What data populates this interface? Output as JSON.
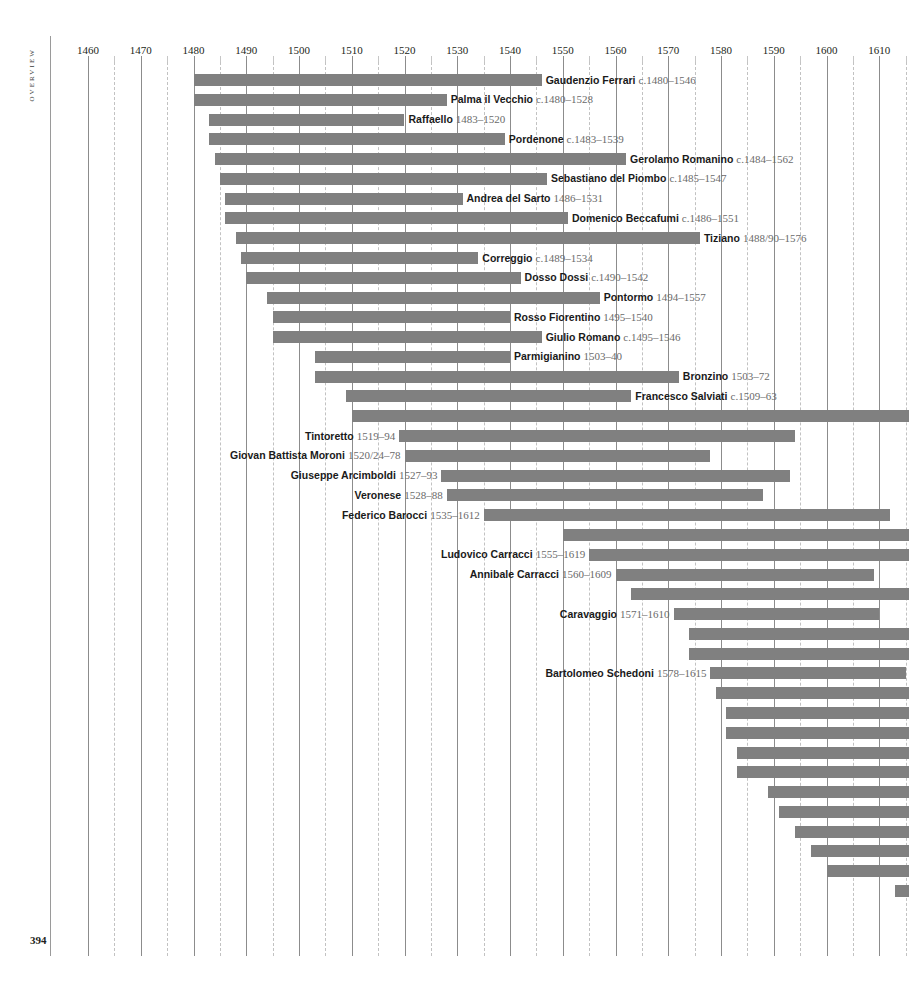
{
  "page": {
    "folio": "394",
    "running_head": "Overview",
    "bar_color": "#808080",
    "grid_major_color": "#8c8c8c",
    "grid_minor_color": "#c2c2c2"
  },
  "chart_data": {
    "type": "bar",
    "orientation": "horizontal",
    "title": "Overview",
    "xlabel": "",
    "ylabel": "",
    "xlim": [
      1455,
      1616
    ],
    "grid": true,
    "legend": null,
    "axis": {
      "major_ticks": [
        1460,
        1470,
        1480,
        1490,
        1500,
        1510,
        1520,
        1530,
        1540,
        1550,
        1560,
        1570,
        1580,
        1590,
        1600,
        1610
      ],
      "minor_ticks": [
        1465,
        1475,
        1485,
        1495,
        1505,
        1515,
        1525,
        1535,
        1545,
        1555,
        1565,
        1575,
        1585,
        1595,
        1605,
        1615
      ],
      "tick_labels": [
        "1460",
        "1470",
        "1480",
        "1490",
        "1500",
        "1510",
        "1520",
        "1530",
        "1540",
        "1550",
        "1560",
        "1570",
        "1580",
        "1590",
        "1600",
        "1610"
      ]
    },
    "categories": [
      "Gaudenzio Ferrari",
      "Palma il Vecchio",
      "Raffaello",
      "Pordenone",
      "Gerolamo Romanino",
      "Sebastiano del Piombo",
      "Andrea del Sarto",
      "Domenico Beccafumi",
      "Tiziano",
      "Correggio",
      "Dosso Dossi",
      "Pontormo",
      "Rosso Fiorentino",
      "Giulio Romano",
      "Parmigianino",
      "Bronzino",
      "Francesco Salviati",
      "Jacopo Bassano",
      "Tintoretto",
      "Giovan Battista Moroni",
      "Giuseppe Arcimboldi",
      "Veronese",
      "Federico Barocci",
      "",
      "Ludovico Carracci",
      "Annibale Carracci",
      "",
      "Caravaggio",
      "",
      "",
      "Bartolomeo Schedoni",
      "",
      "",
      "",
      "",
      "",
      "",
      "",
      "",
      "",
      "",
      ""
    ],
    "bars": [
      {
        "name": "Gaudenzio Ferrari",
        "dates": "c.1480–1546",
        "start": 1480,
        "end": 1546,
        "label_side": "right",
        "labelled": true
      },
      {
        "name": "Palma il Vecchio",
        "dates": "c.1480–1528",
        "start": 1480,
        "end": 1528,
        "label_side": "right",
        "labelled": true
      },
      {
        "name": "Raffaello",
        "dates": "1483–1520",
        "start": 1483,
        "end": 1520,
        "label_side": "right",
        "labelled": true
      },
      {
        "name": "Pordenone",
        "dates": "c.1483–1539",
        "start": 1483,
        "end": 1539,
        "label_side": "right",
        "labelled": true
      },
      {
        "name": "Gerolamo Romanino",
        "dates": "c.1484–1562",
        "start": 1484,
        "end": 1562,
        "label_side": "right",
        "labelled": true
      },
      {
        "name": "Sebastiano del Piombo",
        "dates": "c.1485–1547",
        "start": 1485,
        "end": 1547,
        "label_side": "right",
        "labelled": true
      },
      {
        "name": "Andrea del Sarto",
        "dates": "1486–1531",
        "start": 1486,
        "end": 1531,
        "label_side": "right",
        "labelled": true
      },
      {
        "name": "Domenico Beccafumi",
        "dates": "c.1486–1551",
        "start": 1486,
        "end": 1551,
        "label_side": "right",
        "labelled": true
      },
      {
        "name": "Tiziano",
        "dates": "1488/90–1576",
        "start": 1488,
        "end": 1576,
        "label_side": "right",
        "labelled": true
      },
      {
        "name": "Correggio",
        "dates": "c.1489–1534",
        "start": 1489,
        "end": 1534,
        "label_side": "right",
        "labelled": true
      },
      {
        "name": "Dosso Dossi",
        "dates": "c.1490–1542",
        "start": 1490,
        "end": 1542,
        "label_side": "right",
        "labelled": true
      },
      {
        "name": "Pontormo",
        "dates": "1494–1557",
        "start": 1494,
        "end": 1557,
        "label_side": "right",
        "labelled": true
      },
      {
        "name": "Rosso Fiorentino",
        "dates": "1495–1540",
        "start": 1495,
        "end": 1540,
        "label_side": "right",
        "labelled": true
      },
      {
        "name": "Giulio Romano",
        "dates": "c.1495–1546",
        "start": 1495,
        "end": 1546,
        "label_side": "right",
        "labelled": true
      },
      {
        "name": "Parmigianino",
        "dates": "1503–40",
        "start": 1503,
        "end": 1540,
        "label_side": "right",
        "labelled": true
      },
      {
        "name": "Bronzino",
        "dates": "1503–72",
        "start": 1503,
        "end": 1572,
        "label_side": "right",
        "labelled": true
      },
      {
        "name": "Francesco Salviati",
        "dates": "c.1509–63",
        "start": 1509,
        "end": 1563,
        "label_side": "right",
        "labelled": true
      },
      {
        "name": "Jacopo Bassano",
        "dates": "c.1510–",
        "start": 1510,
        "end": 1616,
        "label_side": "right",
        "labelled": true
      },
      {
        "name": "Tintoretto",
        "dates": "1519–94",
        "start": 1519,
        "end": 1594,
        "label_side": "left",
        "labelled": true
      },
      {
        "name": "Giovan Battista Moroni",
        "dates": "1520/24–78",
        "start": 1520,
        "end": 1578,
        "label_side": "left",
        "labelled": true
      },
      {
        "name": "Giuseppe Arcimboldi",
        "dates": "1527–93",
        "start": 1527,
        "end": 1593,
        "label_side": "left",
        "labelled": true
      },
      {
        "name": "Veronese",
        "dates": "1528–88",
        "start": 1528,
        "end": 1588,
        "label_side": "left",
        "labelled": true
      },
      {
        "name": "Federico Barocci",
        "dates": "1535–1612",
        "start": 1535,
        "end": 1612,
        "label_side": "left",
        "labelled": true
      },
      {
        "name": "",
        "dates": "",
        "start": 1550,
        "end": 1616,
        "label_side": "none",
        "labelled": false
      },
      {
        "name": "Ludovico Carracci",
        "dates": "1555–1619",
        "start": 1555,
        "end": 1616,
        "label_side": "left",
        "labelled": true
      },
      {
        "name": "Annibale Carracci",
        "dates": "1560–1609",
        "start": 1560,
        "end": 1609,
        "label_side": "left",
        "labelled": true
      },
      {
        "name": "",
        "dates": "",
        "start": 1563,
        "end": 1616,
        "label_side": "none",
        "labelled": false
      },
      {
        "name": "Caravaggio",
        "dates": "1571–1610",
        "start": 1571,
        "end": 1610,
        "label_side": "left",
        "labelled": true
      },
      {
        "name": "",
        "dates": "",
        "start": 1574,
        "end": 1616,
        "label_side": "none",
        "labelled": false
      },
      {
        "name": "",
        "dates": "",
        "start": 1574,
        "end": 1616,
        "label_side": "none",
        "labelled": false
      },
      {
        "name": "Bartolomeo Schedoni",
        "dates": "1578–1615",
        "start": 1578,
        "end": 1615,
        "label_side": "left",
        "labelled": true
      },
      {
        "name": "",
        "dates": "",
        "start": 1579,
        "end": 1616,
        "label_side": "none",
        "labelled": false
      },
      {
        "name": "",
        "dates": "",
        "start": 1581,
        "end": 1616,
        "label_side": "none",
        "labelled": false
      },
      {
        "name": "",
        "dates": "",
        "start": 1581,
        "end": 1616,
        "label_side": "none",
        "labelled": false
      },
      {
        "name": "",
        "dates": "",
        "start": 1583,
        "end": 1616,
        "label_side": "none",
        "labelled": false
      },
      {
        "name": "",
        "dates": "",
        "start": 1583,
        "end": 1616,
        "label_side": "none",
        "labelled": false
      },
      {
        "name": "",
        "dates": "",
        "start": 1589,
        "end": 1616,
        "label_side": "none",
        "labelled": false
      },
      {
        "name": "",
        "dates": "",
        "start": 1591,
        "end": 1616,
        "label_side": "none",
        "labelled": false
      },
      {
        "name": "",
        "dates": "",
        "start": 1594,
        "end": 1616,
        "label_side": "none",
        "labelled": false
      },
      {
        "name": "",
        "dates": "",
        "start": 1597,
        "end": 1616,
        "label_side": "none",
        "labelled": false
      },
      {
        "name": "",
        "dates": "",
        "start": 1600,
        "end": 1616,
        "label_side": "none",
        "labelled": false
      },
      {
        "name": "",
        "dates": "",
        "start": 1613,
        "end": 1616,
        "label_side": "none",
        "labelled": false
      }
    ]
  }
}
